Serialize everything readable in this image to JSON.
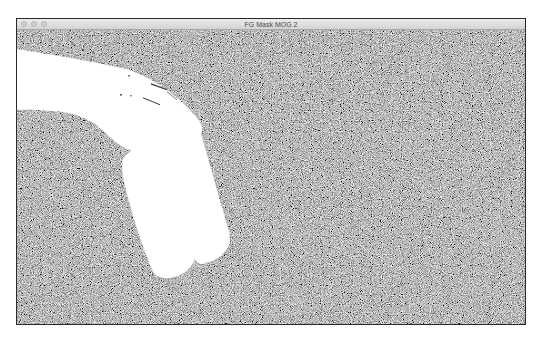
{
  "window": {
    "title": "FG Mask MOG 2",
    "controls": {
      "close": "close-button",
      "minimize": "minimize-button",
      "zoom": "zoom-button",
      "state": "inactive"
    }
  },
  "content": {
    "description": "Foreground mask output (MOG2 background subtraction)",
    "background": "grayscale random noise",
    "foreground_shape": "white silhouette of arm and hand holding bottle",
    "colors": {
      "foreground": "#ffffff",
      "noise_dark": "#000000",
      "noise_light": "#ffffff",
      "titlebar_top": "#ececec",
      "titlebar_bottom": "#d3d3d3",
      "window_border": "#2b2b2b",
      "title_text": "#4a4a4a"
    }
  }
}
